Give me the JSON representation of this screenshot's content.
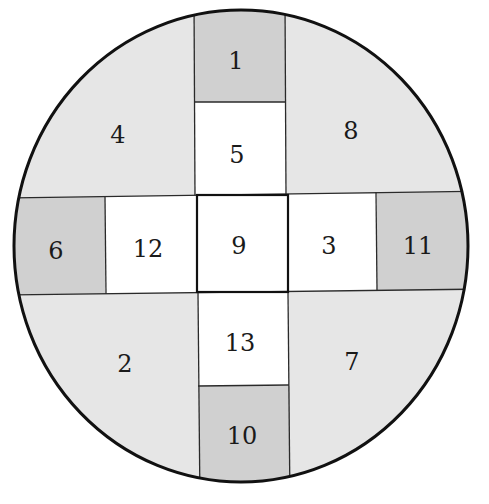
{
  "diagram": {
    "shape": "circle divided into 13 numbered regions forming a cross pattern",
    "colors": {
      "outer_light": "#e6e6e6",
      "arm_end_dark": "#d0d0d0",
      "inner_white": "#ffffff",
      "lines": "#1a1a1a"
    },
    "regions": [
      {
        "id": "1",
        "label": "1",
        "position": "top arm end",
        "fill": "dark"
      },
      {
        "id": "2",
        "label": "2",
        "position": "bottom-left quadrant",
        "fill": "light"
      },
      {
        "id": "3",
        "label": "3",
        "position": "right of center",
        "fill": "white"
      },
      {
        "id": "4",
        "label": "4",
        "position": "top-left quadrant",
        "fill": "light"
      },
      {
        "id": "5",
        "label": "5",
        "position": "above center",
        "fill": "white"
      },
      {
        "id": "6",
        "label": "6",
        "position": "left arm end",
        "fill": "dark"
      },
      {
        "id": "7",
        "label": "7",
        "position": "bottom-right quadrant",
        "fill": "light"
      },
      {
        "id": "8",
        "label": "8",
        "position": "top-right quadrant",
        "fill": "light"
      },
      {
        "id": "9",
        "label": "9",
        "position": "center",
        "fill": "white"
      },
      {
        "id": "10",
        "label": "10",
        "position": "bottom arm end",
        "fill": "dark"
      },
      {
        "id": "11",
        "label": "11",
        "position": "right arm end",
        "fill": "dark"
      },
      {
        "id": "12",
        "label": "12",
        "position": "left of center",
        "fill": "white"
      },
      {
        "id": "13",
        "label": "13",
        "position": "below center",
        "fill": "white"
      }
    ]
  }
}
